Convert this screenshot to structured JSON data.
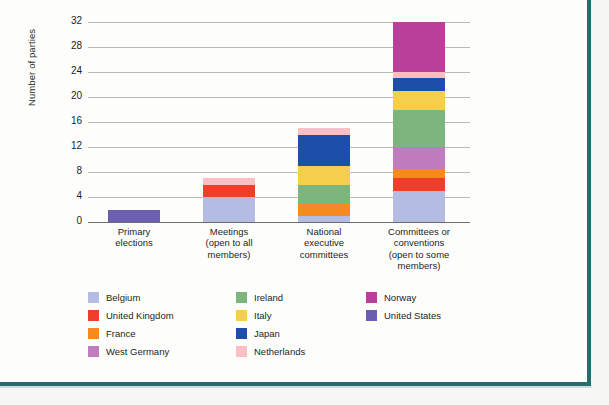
{
  "frame": {
    "border_color": "#276b6b",
    "page_background": "#f7f7f5",
    "plot_background": "#fdfdfc"
  },
  "chart_data": {
    "type": "bar",
    "stacked": true,
    "title": "",
    "subtitle": "",
    "xlabel": "",
    "ylabel": "Number of parties",
    "ylim": [
      0,
      32
    ],
    "yticks": [
      0,
      4,
      8,
      12,
      16,
      20,
      24,
      28,
      32
    ],
    "ytick_labels": [
      "0",
      "4",
      "8",
      "12",
      "16",
      "20",
      "24",
      "28",
      "32"
    ],
    "grid": true,
    "grid_axis": "y",
    "legend_position": "bottom",
    "categories": [
      "Primary elections",
      "Meetings (open to all members)",
      "National executive committees",
      "Committees or conventions (open to some members)"
    ],
    "category_lines": [
      [
        "Primary",
        "elections"
      ],
      [
        "Meetings",
        "(open to all",
        "members)"
      ],
      [
        "National",
        "executive",
        "committees"
      ],
      [
        "Committees or",
        "conventions",
        "(open to some",
        "members)"
      ]
    ],
    "series": [
      {
        "name": "Belgium",
        "color": "#b5bce4",
        "values": [
          0,
          4,
          1,
          5
        ]
      },
      {
        "name": "United Kingdom",
        "color": "#ef3e29",
        "values": [
          0,
          2,
          0,
          2
        ]
      },
      {
        "name": "France",
        "color": "#f58a21",
        "values": [
          0,
          0,
          2,
          1.5
        ]
      },
      {
        "name": "West Germany",
        "color": "#c07cbe",
        "values": [
          0,
          0,
          0,
          3.5
        ]
      },
      {
        "name": "Ireland",
        "color": "#7cb57e",
        "values": [
          0,
          0,
          3,
          6
        ]
      },
      {
        "name": "Italy",
        "color": "#f5ce4e",
        "values": [
          0,
          0,
          3,
          3
        ]
      },
      {
        "name": "Japan",
        "color": "#1d4ea8",
        "values": [
          0,
          0,
          5,
          2
        ]
      },
      {
        "name": "Netherlands",
        "color": "#f9bfc4",
        "values": [
          0,
          1,
          1,
          1
        ]
      },
      {
        "name": "Norway",
        "color": "#b9409a",
        "values": [
          0,
          0,
          0,
          8
        ]
      },
      {
        "name": "United States",
        "color": "#6c5eb0",
        "values": [
          2,
          0,
          0,
          0
        ]
      }
    ],
    "totals": [
      2,
      7,
      15,
      32
    ]
  },
  "legend": {
    "columns": [
      [
        {
          "label": "Belgium",
          "color": "#b5bce4"
        },
        {
          "label": "United Kingdom",
          "color": "#ef3e29"
        },
        {
          "label": "France",
          "color": "#f58a21"
        },
        {
          "label": "West Germany",
          "color": "#c07cbe"
        }
      ],
      [
        {
          "label": "Ireland",
          "color": "#7cb57e"
        },
        {
          "label": "Italy",
          "color": "#f5ce4e"
        },
        {
          "label": "Japan",
          "color": "#1d4ea8"
        },
        {
          "label": "Netherlands",
          "color": "#f9bfc4"
        }
      ],
      [
        {
          "label": "Norway",
          "color": "#b9409a"
        },
        {
          "label": "United States",
          "color": "#6c5eb0"
        }
      ]
    ]
  }
}
